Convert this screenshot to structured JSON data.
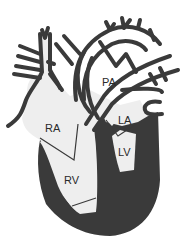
{
  "diagram": {
    "colors": {
      "fill": "#eeeeee",
      "outline": "#3a3a3a",
      "myocardium": "#3a3a3a",
      "background": "#ffffff"
    },
    "labels": {
      "pa": "PA",
      "ra": "RA",
      "la": "LA",
      "lv": "LV",
      "rv": "RV"
    }
  }
}
